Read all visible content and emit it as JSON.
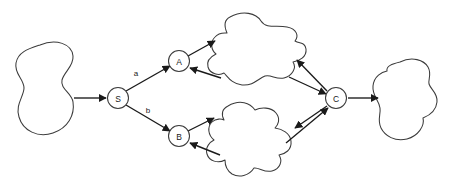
{
  "diagram": {
    "type": "node-link-diagram",
    "background_color": "#ffffff",
    "stroke_color": "#1a1a1a",
    "blob_stroke_color": "#3b3b3b",
    "nodes": [
      {
        "id": "S",
        "label": "S",
        "cx": 118,
        "cy": 98,
        "r": 10.5,
        "role": "source"
      },
      {
        "id": "A",
        "label": "A",
        "cx": 179,
        "cy": 61,
        "r": 10.5,
        "role": "branch-upper"
      },
      {
        "id": "B",
        "label": "B",
        "cx": 179,
        "cy": 136,
        "r": 10.5,
        "role": "branch-lower"
      },
      {
        "id": "C",
        "label": "C",
        "cx": 336,
        "cy": 98,
        "r": 10.5,
        "role": "collector"
      }
    ],
    "blobs": [
      {
        "id": "blob-left",
        "role": "input-region",
        "cx": 48,
        "cy": 91
      },
      {
        "id": "blob-top",
        "role": "upper-region",
        "cx": 255,
        "cy": 52
      },
      {
        "id": "blob-bottom",
        "role": "lower-region",
        "cx": 255,
        "cy": 140
      },
      {
        "id": "blob-right",
        "role": "output-region",
        "cx": 410,
        "cy": 100
      }
    ],
    "edges": [
      {
        "id": "edge-input-to-S",
        "from": "blob-left",
        "to": "S",
        "label": "",
        "directed": true
      },
      {
        "id": "edge-S-to-A",
        "from": "S",
        "to": "A",
        "label": "a",
        "directed": true
      },
      {
        "id": "edge-S-to-B",
        "from": "S",
        "to": "B",
        "label": "b",
        "directed": true
      },
      {
        "id": "edge-A-to-blob-top",
        "from": "A",
        "to": "blob-top",
        "label": "",
        "directed": true
      },
      {
        "id": "edge-blob-top-to-A",
        "from": "blob-top",
        "to": "A",
        "label": "",
        "directed": true
      },
      {
        "id": "edge-B-to-blob-bottom",
        "from": "B",
        "to": "blob-bottom",
        "label": "",
        "directed": true
      },
      {
        "id": "edge-blob-bottom-to-B",
        "from": "blob-bottom",
        "to": "B",
        "label": "",
        "directed": true
      },
      {
        "id": "edge-C-to-blob-top",
        "from": "C",
        "to": "blob-top",
        "label": "",
        "directed": true
      },
      {
        "id": "edge-blob-top-to-C",
        "from": "blob-top",
        "to": "C",
        "label": "",
        "directed": true
      },
      {
        "id": "edge-C-to-blob-bottom",
        "from": "C",
        "to": "blob-bottom",
        "label": "",
        "directed": true
      },
      {
        "id": "edge-blob-bottom-to-C",
        "from": "blob-bottom",
        "to": "C",
        "label": "",
        "directed": true
      },
      {
        "id": "edge-C-to-output",
        "from": "C",
        "to": "blob-right",
        "label": "",
        "directed": true
      }
    ],
    "edge_labels": {
      "a": "a",
      "b": "b"
    },
    "node_labels": {
      "s": "S",
      "a": "A",
      "b": "B",
      "c": "C"
    }
  }
}
